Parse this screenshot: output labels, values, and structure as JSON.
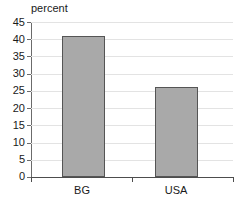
{
  "chart_data": {
    "type": "bar",
    "title": "",
    "xlabel": "",
    "ylabel": "percent",
    "categories": [
      "BG",
      "USA"
    ],
    "values": [
      41,
      26
    ],
    "ylim": [
      0,
      45
    ],
    "yticks": [
      0,
      5,
      10,
      15,
      20,
      25,
      30,
      35,
      40,
      45
    ],
    "ytick_labels": [
      "0",
      "5",
      "10",
      "15",
      "20",
      "25",
      "30",
      "35",
      "40",
      "45"
    ],
    "grid": true,
    "legend": "none",
    "series": [
      {
        "name": "percent",
        "values": [
          41,
          26
        ]
      }
    ],
    "bar_color": "#a9a9a9",
    "bar_edge_color": "#555555",
    "gridline_color": "#e3e3e3",
    "axis_color": "#4d4d4d",
    "text_color": "#1a1a1a"
  }
}
